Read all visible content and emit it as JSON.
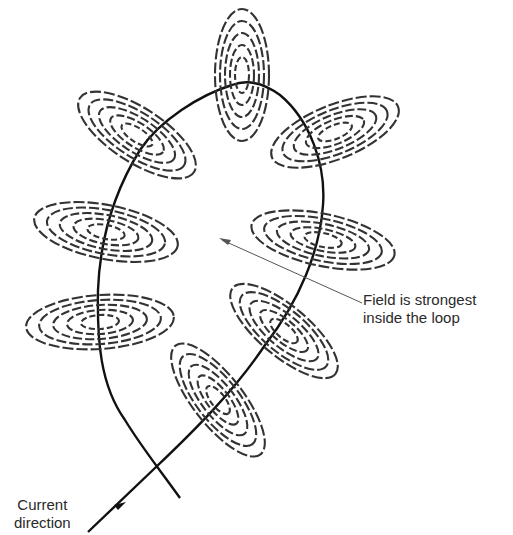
{
  "figure": {
    "wire_color": "#111111",
    "field_line_color": "#333333",
    "annotations": {
      "field_label_line1": "Field is strongest",
      "field_label_line2": "inside the loop",
      "current_label_line1": "Current",
      "current_label_line2": "direction"
    },
    "field_rings": [
      {
        "name": "top",
        "cx": 242,
        "cy": 75,
        "rx": 26,
        "ry": 66,
        "rotate": 0
      },
      {
        "name": "upper-left",
        "cx": 137,
        "cy": 135,
        "rx": 68,
        "ry": 26,
        "rotate": 33
      },
      {
        "name": "upper-right",
        "cx": 337,
        "cy": 130,
        "rx": 68,
        "ry": 26,
        "rotate": -22
      },
      {
        "name": "mid-left",
        "cx": 106,
        "cy": 230,
        "rx": 73,
        "ry": 28,
        "rotate": 10
      },
      {
        "name": "mid-right",
        "cx": 323,
        "cy": 240,
        "rx": 73,
        "ry": 26,
        "rotate": 12
      },
      {
        "name": "lower-left",
        "cx": 100,
        "cy": 322,
        "rx": 74,
        "ry": 27,
        "rotate": -5
      },
      {
        "name": "lower-right",
        "cx": 285,
        "cy": 330,
        "rx": 66,
        "ry": 25,
        "rotate": 40
      },
      {
        "name": "bottom",
        "cx": 218,
        "cy": 400,
        "rx": 68,
        "ry": 25,
        "rotate": 52
      }
    ]
  }
}
